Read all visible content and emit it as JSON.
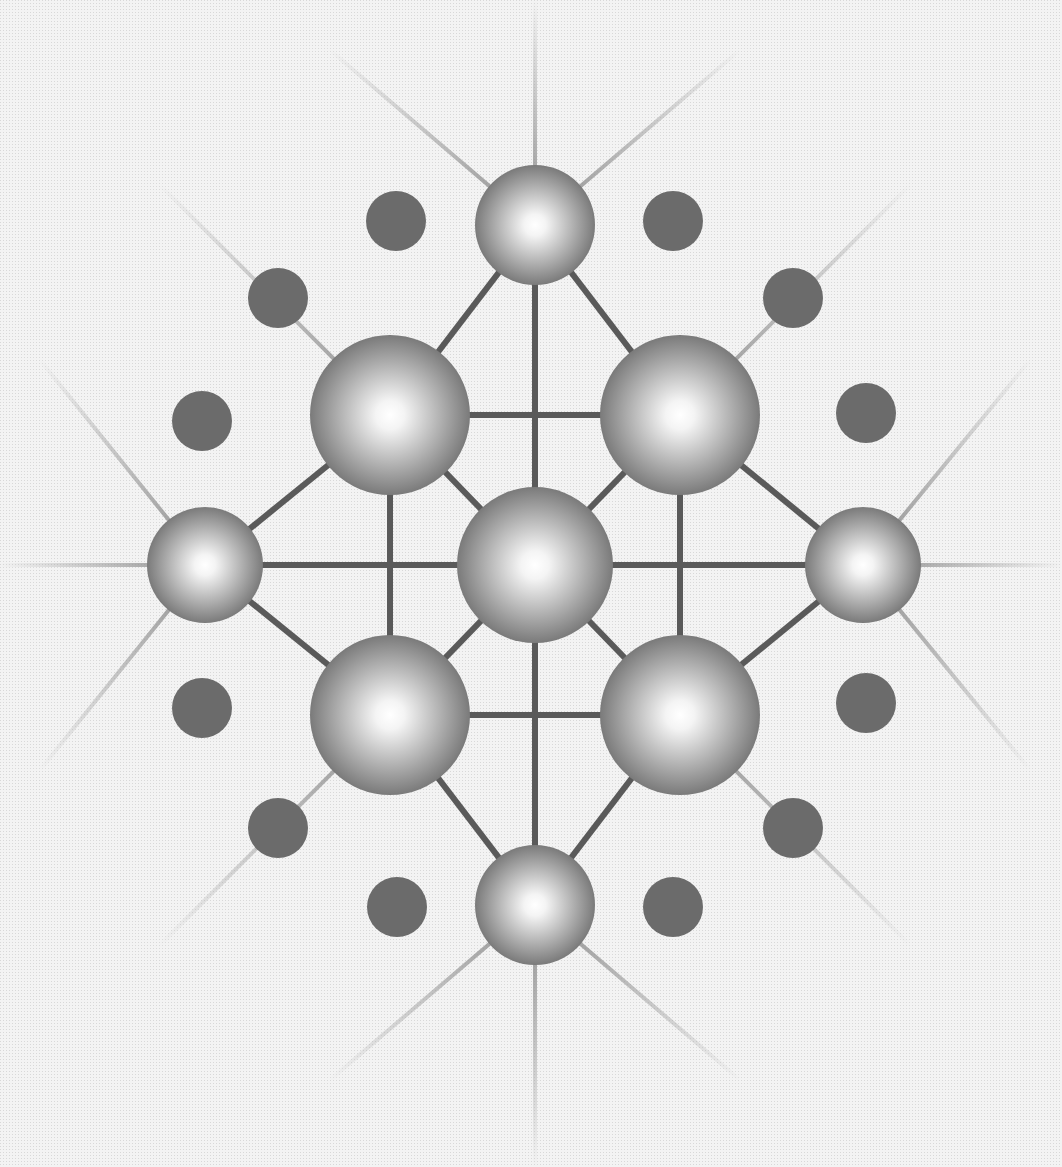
{
  "diagram": {
    "title": "",
    "type": "crystal-lattice",
    "canvas": {
      "width": 1062,
      "height": 1167,
      "background": "#efefef"
    },
    "colors": {
      "bond": "#5a5a5a",
      "ray": "#8a8a8a",
      "sphere_dark": "#6a6a6a",
      "sphere_mid": "#a8a8a8",
      "sphere_highlight": "#ffffff",
      "dot": "#6b6b6b"
    },
    "spheres": [
      {
        "id": "center",
        "cx": 535,
        "cy": 565,
        "r": 78
      },
      {
        "id": "top",
        "cx": 535,
        "cy": 225,
        "r": 60
      },
      {
        "id": "bottom",
        "cx": 535,
        "cy": 905,
        "r": 60
      },
      {
        "id": "left",
        "cx": 205,
        "cy": 565,
        "r": 58
      },
      {
        "id": "right",
        "cx": 863,
        "cy": 565,
        "r": 58
      },
      {
        "id": "upper-left",
        "cx": 390,
        "cy": 415,
        "r": 80
      },
      {
        "id": "upper-right",
        "cx": 680,
        "cy": 415,
        "r": 80
      },
      {
        "id": "lower-left",
        "cx": 390,
        "cy": 715,
        "r": 80
      },
      {
        "id": "lower-right",
        "cx": 680,
        "cy": 715,
        "r": 80
      }
    ],
    "dots": [
      {
        "cx": 396,
        "cy": 221,
        "r": 30
      },
      {
        "cx": 673,
        "cy": 221,
        "r": 30
      },
      {
        "cx": 278,
        "cy": 298,
        "r": 30
      },
      {
        "cx": 793,
        "cy": 298,
        "r": 30
      },
      {
        "cx": 202,
        "cy": 421,
        "r": 30
      },
      {
        "cx": 866,
        "cy": 413,
        "r": 30
      },
      {
        "cx": 202,
        "cy": 708,
        "r": 30
      },
      {
        "cx": 866,
        "cy": 703,
        "r": 30
      },
      {
        "cx": 278,
        "cy": 828,
        "r": 30
      },
      {
        "cx": 793,
        "cy": 828,
        "r": 30
      },
      {
        "cx": 397,
        "cy": 907,
        "r": 30
      },
      {
        "cx": 673,
        "cy": 907,
        "r": 30
      }
    ],
    "bonds": [
      [
        535,
        225,
        535,
        905
      ],
      [
        205,
        565,
        863,
        565
      ],
      [
        390,
        415,
        680,
        415
      ],
      [
        390,
        715,
        680,
        715
      ],
      [
        390,
        415,
        390,
        715
      ],
      [
        680,
        415,
        680,
        715
      ],
      [
        535,
        225,
        390,
        415
      ],
      [
        535,
        225,
        680,
        415
      ],
      [
        535,
        905,
        390,
        715
      ],
      [
        535,
        905,
        680,
        715
      ],
      [
        205,
        565,
        390,
        415
      ],
      [
        205,
        565,
        390,
        715
      ],
      [
        863,
        565,
        680,
        415
      ],
      [
        863,
        565,
        680,
        715
      ],
      [
        535,
        565,
        390,
        415
      ],
      [
        535,
        565,
        680,
        415
      ],
      [
        535,
        565,
        390,
        715
      ],
      [
        535,
        565,
        680,
        715
      ]
    ],
    "rays": [
      [
        535,
        225,
        535,
        0
      ],
      [
        535,
        905,
        535,
        1167
      ],
      [
        205,
        565,
        0,
        565
      ],
      [
        863,
        565,
        1062,
        565
      ],
      [
        535,
        225,
        330,
        50
      ],
      [
        535,
        225,
        740,
        50
      ],
      [
        535,
        905,
        330,
        1080
      ],
      [
        535,
        905,
        740,
        1080
      ],
      [
        205,
        565,
        40,
        360
      ],
      [
        205,
        565,
        40,
        770
      ],
      [
        863,
        565,
        1030,
        360
      ],
      [
        863,
        565,
        1030,
        770
      ],
      [
        390,
        415,
        160,
        185
      ],
      [
        680,
        415,
        910,
        185
      ],
      [
        390,
        715,
        160,
        945
      ],
      [
        680,
        715,
        910,
        945
      ]
    ]
  }
}
